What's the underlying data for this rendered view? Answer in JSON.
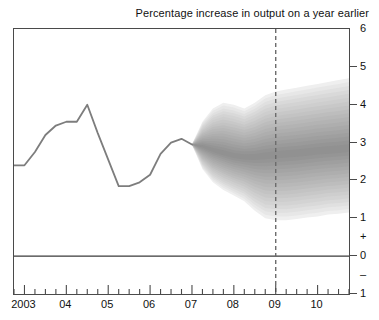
{
  "chart_data": {
    "type": "area",
    "title": "Percentage increase in output on a year earlier",
    "xlabel": "",
    "ylabel": "",
    "ylim": [
      -1,
      6
    ],
    "xlim": [
      2002.75,
      2010.75
    ],
    "grid": false,
    "legend": "none",
    "y_ticks": [
      6,
      5,
      4,
      3,
      2,
      1,
      0,
      -1
    ],
    "y_tick_labels": [
      "6",
      "5",
      "4",
      "3",
      "2",
      "1",
      "+",
      "0",
      "–",
      "1"
    ],
    "y_sign_labels": {
      "plus": "+",
      "minus": "–",
      "plus_value": 0.5,
      "minus_value": -0.5
    },
    "x_ticks": [
      2003,
      2004,
      2005,
      2006,
      2007,
      2008,
      2009,
      2010
    ],
    "x_tick_labels": [
      "2003",
      "04",
      "05",
      "06",
      "07",
      "08",
      "09",
      "10"
    ],
    "minor_ticks_per_year": 4,
    "zero_line": 0,
    "forecast_marker": {
      "label": "09",
      "x": 2009.0,
      "style": "dashed-vertical"
    },
    "series": [
      {
        "name": "Output growth (history)",
        "type": "line",
        "color": "#7d7d7d",
        "x": [
          2002.75,
          2003.0,
          2003.25,
          2003.5,
          2003.75,
          2004.0,
          2004.25,
          2004.5,
          2004.75,
          2005.0,
          2005.25,
          2005.5,
          2005.75,
          2006.0,
          2006.25,
          2006.5,
          2006.75,
          2007.0
        ],
        "values": [
          2.4,
          2.4,
          2.75,
          3.2,
          3.45,
          3.55,
          3.55,
          4.0,
          3.25,
          2.55,
          1.85,
          1.85,
          1.95,
          2.15,
          2.7,
          3.0,
          3.1,
          2.95
        ]
      },
      {
        "name": "Output growth (projection fan)",
        "type": "fan",
        "x": [
          2007.0,
          2007.25,
          2007.5,
          2007.75,
          2008.0,
          2008.25,
          2008.5,
          2008.75,
          2009.0,
          2009.25,
          2009.5,
          2009.75,
          2010.0,
          2010.25,
          2010.5,
          2010.75
        ],
        "central": [
          2.95,
          2.9,
          2.8,
          2.72,
          2.65,
          2.62,
          2.62,
          2.65,
          2.68,
          2.7,
          2.72,
          2.75,
          2.78,
          2.8,
          2.82,
          2.85
        ],
        "upper_90": [
          2.95,
          3.55,
          3.9,
          4.05,
          4.0,
          3.9,
          4.05,
          4.25,
          4.35,
          4.4,
          4.45,
          4.5,
          4.55,
          4.6,
          4.65,
          4.7
        ],
        "lower_90": [
          2.95,
          2.3,
          1.95,
          1.75,
          1.6,
          1.45,
          1.2,
          1.0,
          0.95,
          0.95,
          0.98,
          1.02,
          1.05,
          1.1,
          1.12,
          1.15
        ],
        "bands": 18,
        "band_color_dark": "#8c8c8c",
        "band_color_light": "#efefef"
      }
    ]
  },
  "axis_colors": {
    "frame": "#4a4a4a",
    "line": "#7d7d7d",
    "zero": "#3a3a3a",
    "dashed": "#6b6b6b"
  }
}
